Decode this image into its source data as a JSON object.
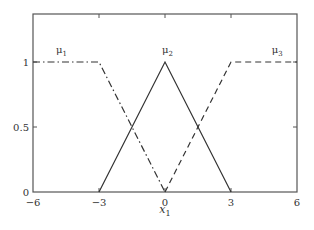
{
  "chart_data": {
    "type": "line",
    "title": "",
    "xlabel": "x1",
    "xlabel_main": "x",
    "xlabel_sub": "1",
    "ylabel": "",
    "xlim": [
      -6,
      6
    ],
    "ylim": [
      0,
      1.3
    ],
    "grid": false,
    "legend": "inline labels",
    "x_ticks": [
      -6,
      -3,
      0,
      3,
      6
    ],
    "x_tick_labels": [
      "−6",
      "−3",
      "0",
      "3",
      "6"
    ],
    "y_ticks": [
      0,
      0.5,
      1
    ],
    "y_tick_labels": [
      "0",
      "0.5",
      "1"
    ],
    "series": [
      {
        "name": "μ1",
        "label_main": "μ",
        "label_sub": "1",
        "style": "dash-dot",
        "x": [
          -6,
          -3,
          0
        ],
        "y": [
          1,
          1,
          0
        ]
      },
      {
        "name": "μ2",
        "label_main": "μ",
        "label_sub": "2",
        "style": "solid",
        "x": [
          -3,
          0,
          3
        ],
        "y": [
          0,
          1,
          0
        ]
      },
      {
        "name": "μ3",
        "label_main": "μ",
        "label_sub": "3",
        "style": "dashed",
        "x": [
          0,
          3,
          6
        ],
        "y": [
          0,
          1,
          1
        ]
      }
    ],
    "colors": {
      "line": "#333333",
      "frame": "#555555"
    }
  }
}
